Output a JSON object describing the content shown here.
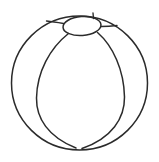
{
  "figure": {
    "background_color": "#ffffff",
    "stroke_color": "#2b2b2b",
    "stroke_width": 1.5,
    "canvas": {
      "width": 159,
      "height": 162
    }
  },
  "shapes": {
    "outer_circle": {
      "name": "ball-outline",
      "center_x": 79.5,
      "center_y": 83,
      "radius_x": 68,
      "radius_y": 67
    },
    "cap_ellipse": {
      "name": "ball-cap",
      "center_x": 82,
      "center_y": 26,
      "radius_x": 19,
      "radius_y": 9.5,
      "rotation": -4
    },
    "seams": [
      {
        "name": "left-meridian",
        "path": "M 68.5 33.5 C 50 48, 37 72, 36.5 98 C 36.2 118, 48 137, 76 148"
      },
      {
        "name": "right-meridian",
        "path": "M 97.5 32.5 C 113 46, 124 70, 124.5 97 C 124.8 118, 112 138, 82 148.5"
      },
      {
        "name": "upper-left-seam",
        "path": "M 63.5 23.5 C 58 22.5, 52 21.5, 46.5 21"
      },
      {
        "name": "upper-right-seam",
        "path": "M 101 26.5 C 107 26.5, 113 26, 117 25.5"
      },
      {
        "name": "top-vertical-seam",
        "path": "M 93.5 18.5 L 93 13"
      }
    ]
  }
}
